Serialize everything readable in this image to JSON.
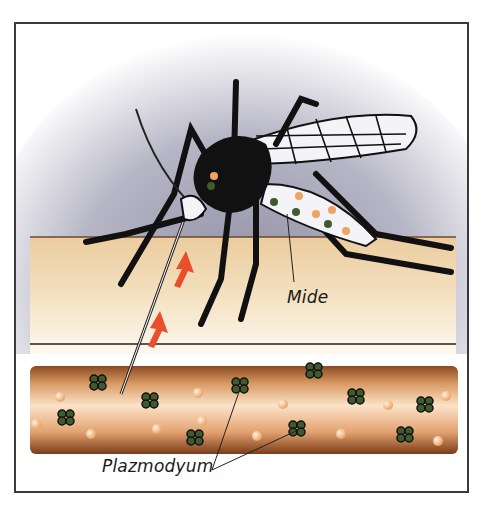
{
  "figure": {
    "labels": {
      "saliva": "Mide",
      "parasite": "Plazmodyum"
    },
    "colors": {
      "frame": "#3a3a3a",
      "skin": "#f1d7ae",
      "vessel": "#c98a55",
      "arrow": "#e8502b",
      "parasite": "#3f5a2e",
      "blood_cell": "#f2b27a",
      "background_glow": "#a7a6b8"
    }
  }
}
